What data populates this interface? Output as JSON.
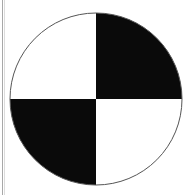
{
  "symbol": {
    "name": "quadrant-marker",
    "center": [
      96,
      99
    ],
    "radius": 86,
    "colors": {
      "fill_dark": "#0a0a0a",
      "fill_light": "#ffffff",
      "outline": "#555555",
      "edge_line": "#a8a8a8"
    },
    "quadrants": [
      {
        "position": "top-left",
        "fill": "white"
      },
      {
        "position": "top-right",
        "fill": "black"
      },
      {
        "position": "bottom-left",
        "fill": "black"
      },
      {
        "position": "bottom-right",
        "fill": "white"
      }
    ]
  }
}
